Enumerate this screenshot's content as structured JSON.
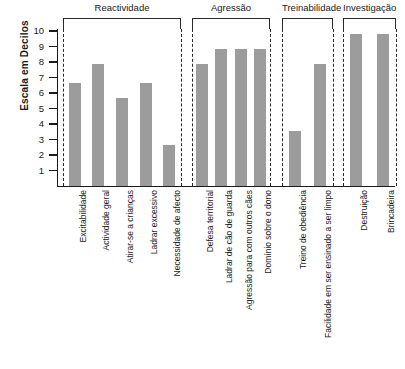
{
  "chart_data": {
    "type": "bar",
    "title": "",
    "xlabel": "",
    "ylabel": "Escala em Decilos",
    "ylim": [
      0,
      10
    ],
    "yticks": [
      10,
      9,
      8,
      7,
      6,
      5,
      4,
      3,
      2,
      1
    ],
    "grid": false,
    "legend": null,
    "bar_color": "#9c9c9c",
    "groups": [
      {
        "name": "Reactividade",
        "categories": [
          "Excitabilidade",
          "Actividade geral",
          "Atirar-se a crianças",
          "Ladrar excessivo",
          "Necessidade de afecto"
        ],
        "values": [
          6.65,
          7.9,
          5.65,
          6.65,
          2.65
        ]
      },
      {
        "name": "Agressão",
        "categories": [
          "Defesa territorial",
          "Ladrar de cão de guarda",
          "Agressão para com outros cães",
          "Domínio sobre o dono"
        ],
        "values": [
          7.9,
          8.85,
          8.85,
          8.85
        ]
      },
      {
        "name": "Treinabilidade",
        "categories": [
          "Treino de obediência",
          "Facilidade em ser ensinado a ser limpo"
        ],
        "values": [
          3.55,
          7.85
        ]
      },
      {
        "name": "Investigação",
        "categories": [
          "Destruição",
          "Brincadeira"
        ],
        "values": [
          9.8,
          9.8
        ]
      }
    ],
    "categories": [
      "Excitabilidade",
      "Actividade geral",
      "Atirar-se a crianças",
      "Ladrar excessivo",
      "Necessidade de afecto",
      "Defesa territorial",
      "Ladrar de cão de guarda",
      "Agressão para com outros cães",
      "Domínio sobre o dono",
      "Treino de obediência",
      "Facilidade em ser ensinado a ser limpo",
      "Destruição",
      "Brincadeira"
    ],
    "values": [
      6.65,
      7.9,
      5.65,
      6.65,
      2.65,
      7.9,
      8.85,
      8.85,
      8.85,
      3.55,
      7.85,
      9.8,
      9.8
    ]
  }
}
